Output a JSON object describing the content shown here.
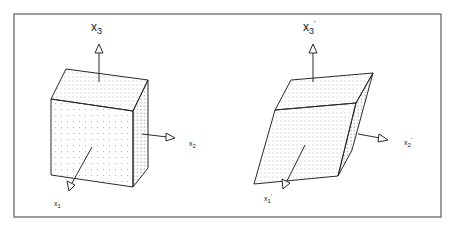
{
  "figure": {
    "colors": {
      "line": "#2a2a2a",
      "frame": "#666666",
      "dots": "#555555",
      "background": "#ffffff"
    },
    "left_panel": {
      "name": "undeformed-cube",
      "axes": {
        "x3": {
          "base": "x",
          "sub": "3",
          "prime": ""
        },
        "x2": {
          "base": "x",
          "sub": "2",
          "prime": ""
        },
        "x1": {
          "base": "x",
          "sub": "1",
          "prime": ""
        }
      }
    },
    "right_panel": {
      "name": "deformed-parallelepiped",
      "axes": {
        "x3": {
          "base": "x",
          "sub": "3",
          "prime": "'"
        },
        "x2": {
          "base": "x",
          "sub": "2",
          "prime": "'"
        },
        "x1": {
          "base": "x",
          "sub": "1",
          "prime": "'"
        }
      }
    }
  }
}
